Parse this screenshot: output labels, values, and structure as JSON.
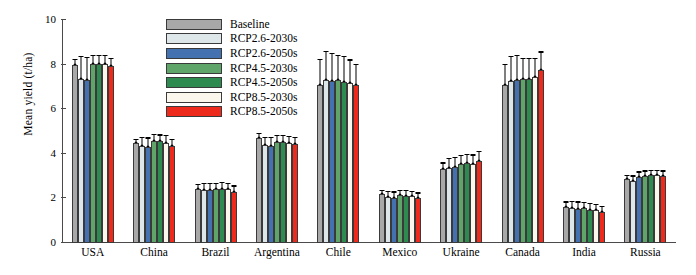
{
  "chart_data": {
    "type": "bar",
    "title": "",
    "xlabel": "",
    "ylabel": "Mean yield (t/ha)",
    "ylim": [
      0,
      10
    ],
    "yticks": [
      0,
      2,
      4,
      6,
      8,
      10
    ],
    "grid": false,
    "legend_position": "top-center",
    "categories": [
      "USA",
      "China",
      "Brazil",
      "Argentina",
      "Chile",
      "Mexico",
      "Ukraine",
      "Canada",
      "India",
      "Russia"
    ],
    "series": [
      {
        "name": "Baseline",
        "color": "#a8a8a8",
        "values": [
          8.0,
          4.47,
          2.43,
          4.72,
          7.1,
          2.18,
          3.32,
          7.08,
          1.63,
          2.88
        ],
        "errors": [
          0.1,
          0.08,
          0.08,
          0.09,
          0.55,
          0.07,
          0.12,
          0.45,
          0.09,
          0.06
        ]
      },
      {
        "name": "RCP2.6-2030s",
        "color": "#dde6e8",
        "values": [
          7.37,
          4.33,
          2.37,
          4.4,
          7.33,
          2.06,
          3.36,
          7.28,
          1.55,
          2.78
        ],
        "errors": [
          0.48,
          0.18,
          0.14,
          0.16,
          0.62,
          0.11,
          0.2,
          0.52,
          0.14,
          0.1
        ]
      },
      {
        "name": "RCP2.6-2050s",
        "color": "#4472b0",
        "values": [
          7.3,
          4.32,
          2.37,
          4.37,
          7.25,
          2.04,
          3.4,
          7.3,
          1.53,
          2.96
        ],
        "errors": [
          0.5,
          0.18,
          0.14,
          0.16,
          0.62,
          0.11,
          0.2,
          0.55,
          0.14,
          0.1
        ]
      },
      {
        "name": "RCP4.5-2030s",
        "color": "#5fa469",
        "values": [
          8.05,
          4.57,
          2.41,
          4.55,
          7.3,
          2.14,
          3.53,
          7.34,
          1.55,
          3.02
        ],
        "errors": [
          0.16,
          0.13,
          0.12,
          0.13,
          0.55,
          0.1,
          0.18,
          0.45,
          0.12,
          0.09
        ]
      },
      {
        "name": "RCP4.5-2050s",
        "color": "#2d8b4f",
        "values": [
          8.03,
          4.56,
          2.43,
          4.54,
          7.22,
          2.13,
          3.57,
          7.35,
          1.5,
          3.03
        ],
        "errors": [
          0.17,
          0.13,
          0.12,
          0.13,
          0.55,
          0.1,
          0.18,
          0.45,
          0.12,
          0.09
        ]
      },
      {
        "name": "RCP8.5-2030s",
        "color": "#fbf7ec",
        "values": [
          8.02,
          4.5,
          2.4,
          4.48,
          7.18,
          2.09,
          3.56,
          7.43,
          1.46,
          3.03
        ],
        "errors": [
          0.18,
          0.14,
          0.12,
          0.14,
          0.5,
          0.1,
          0.18,
          0.4,
          0.12,
          0.09
        ]
      },
      {
        "name": "RCP8.5-2050s",
        "color": "#ed2a1c",
        "values": [
          7.92,
          4.37,
          2.31,
          4.44,
          7.08,
          2.04,
          3.69,
          7.78,
          1.38,
          3.02
        ],
        "errors": [
          0.16,
          0.13,
          0.11,
          0.13,
          0.45,
          0.09,
          0.2,
          0.38,
          0.11,
          0.09
        ]
      }
    ]
  },
  "legend": {
    "items": [
      {
        "label": "Baseline"
      },
      {
        "label": "RCP2.6-2030s"
      },
      {
        "label": "RCP2.6-2050s"
      },
      {
        "label": "RCP4.5-2030s"
      },
      {
        "label": "RCP4.5-2050s"
      },
      {
        "label": "RCP8.5-2030s"
      },
      {
        "label": "RCP8.5-2050s"
      }
    ]
  }
}
